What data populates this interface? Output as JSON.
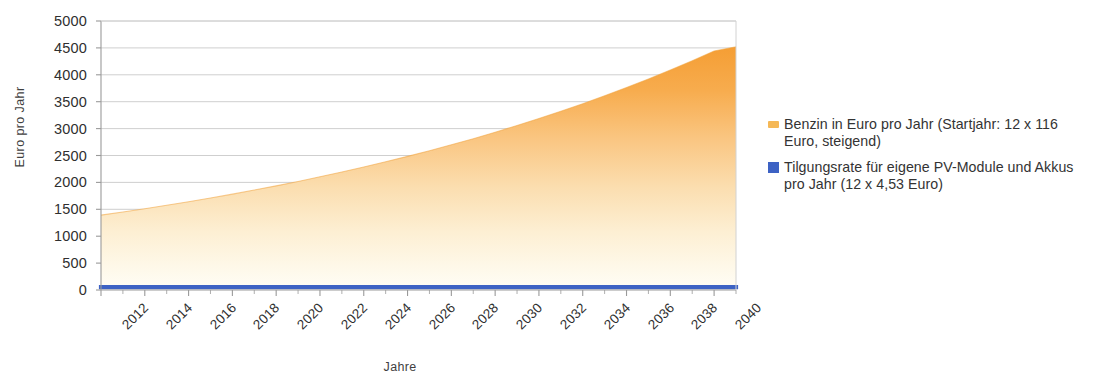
{
  "chart_data": {
    "type": "area",
    "title": "",
    "xlabel": "Jahre",
    "ylabel": "Euro pro Jahr",
    "xlim": [
      2012,
      2041
    ],
    "ylim": [
      0,
      5000
    ],
    "grid": true,
    "legend_position": "right",
    "y_ticks": [
      0,
      500,
      1000,
      1500,
      2000,
      2500,
      3000,
      3500,
      4000,
      4500,
      5000
    ],
    "y_tick_labels": [
      "0",
      "500",
      "1000",
      "1500",
      "2000",
      "2500",
      "3000",
      "3500",
      "4000",
      "4500",
      "5000"
    ],
    "x_ticks": [
      2012,
      2014,
      2016,
      2018,
      2020,
      2022,
      2024,
      2026,
      2028,
      2030,
      2032,
      2034,
      2036,
      2038,
      2040
    ],
    "x_tick_labels": [
      "2012",
      "2014",
      "2016",
      "2018",
      "2020",
      "2022",
      "2024",
      "2026",
      "2028",
      "2030",
      "2032",
      "2034",
      "2036",
      "2038",
      "2040"
    ],
    "x": [
      2012,
      2013,
      2014,
      2015,
      2016,
      2017,
      2018,
      2019,
      2020,
      2021,
      2022,
      2023,
      2024,
      2025,
      2026,
      2027,
      2028,
      2029,
      2030,
      2031,
      2032,
      2033,
      2034,
      2035,
      2036,
      2037,
      2038,
      2039,
      2040,
      2041
    ],
    "series": [
      {
        "name": "Benzin in Euro pro Jahr (Startjahr: 12 x 116 Euro, steigend)",
        "type": "area",
        "color": "#F0A33C",
        "fill_gradient_top": "#F6A23C",
        "fill_gradient_bottom": "#FCF6E2",
        "values": [
          1392,
          1450,
          1510,
          1574,
          1640,
          1710,
          1782,
          1858,
          1936,
          2018,
          2104,
          2193,
          2286,
          2383,
          2484,
          2589,
          2699,
          2813,
          2933,
          3057,
          3187,
          3322,
          3463,
          3610,
          3763,
          3923,
          4089,
          4262,
          4443,
          4520
        ]
      },
      {
        "name": "Tilgungsrate für eigene PV-Module und Akkus pro Jahr (12 x 4,53 Euro)",
        "type": "line",
        "color": "#3D62C4",
        "values": [
          54.36,
          54.36,
          54.36,
          54.36,
          54.36,
          54.36,
          54.36,
          54.36,
          54.36,
          54.36,
          54.36,
          54.36,
          54.36,
          54.36,
          54.36,
          54.36,
          54.36,
          54.36,
          54.36,
          54.36,
          54.36,
          54.36,
          54.36,
          54.36,
          54.36,
          54.36,
          54.36,
          54.36,
          54.36,
          54.36
        ]
      }
    ]
  },
  "legend": {
    "entries": [
      {
        "label": "Benzin in Euro pro Jahr (Startjahr: 12 x 116 Euro, steigend)",
        "color": "#F5B856",
        "marker": "area-swatch"
      },
      {
        "label": "Tilgungsrate für eigene PV-Module und Akkus pro Jahr (12 x 4,53 Euro)",
        "color": "#3D62C4",
        "marker": "square-swatch"
      }
    ]
  },
  "axes": {
    "y_title": "Euro pro Jahr",
    "x_title": "Jahre",
    "axis_color": "#9a9a9a",
    "grid_color": "#c9c9c9"
  }
}
